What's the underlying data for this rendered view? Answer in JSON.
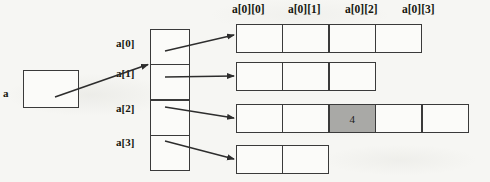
{
  "figure": {
    "type": "jagged-array-memory-diagram",
    "background_color": "#f6f6f3",
    "line_color": "#3a3a3a",
    "text_color": "#17170f",
    "highlight_color": "#a9a9a6"
  },
  "root_pointer": {
    "label": "a",
    "box_value": ""
  },
  "pointer_array": {
    "name": "a",
    "labels": [
      "a[0]",
      "a[1]",
      "a[2]",
      "a[3]"
    ],
    "cells": [
      "",
      "",
      "",
      ""
    ]
  },
  "column_headers": [
    "a[0][0]",
    "a[0][1]",
    "a[0][2]",
    "a[0][3]"
  ],
  "rows": [
    {
      "index": 0,
      "source_label": "a[0]",
      "length": 4,
      "cells": [
        {
          "value": "",
          "highlighted": false
        },
        {
          "value": "",
          "highlighted": false
        },
        {
          "value": "",
          "highlighted": false
        },
        {
          "value": "",
          "highlighted": false
        }
      ]
    },
    {
      "index": 1,
      "source_label": "a[1]",
      "length": 3,
      "cells": [
        {
          "value": "",
          "highlighted": false
        },
        {
          "value": "",
          "highlighted": false
        },
        {
          "value": "",
          "highlighted": false
        }
      ]
    },
    {
      "index": 2,
      "source_label": "a[2]",
      "length": 5,
      "cells": [
        {
          "value": "",
          "highlighted": false
        },
        {
          "value": "",
          "highlighted": false
        },
        {
          "value": "4",
          "highlighted": true
        },
        {
          "value": "",
          "highlighted": false
        },
        {
          "value": "",
          "highlighted": false
        }
      ]
    },
    {
      "index": 3,
      "source_label": "a[3]",
      "length": 2,
      "cells": [
        {
          "value": "",
          "highlighted": false
        },
        {
          "value": "",
          "highlighted": false
        }
      ]
    }
  ],
  "arrows": [
    {
      "name": "a-to-pointer-array",
      "from": "root-pointer-box",
      "to": "pointer-array-cell-0"
    },
    {
      "name": "pointer-0-to-row-0",
      "from": "pointer-array-cell-0",
      "to": "row-0"
    },
    {
      "name": "pointer-1-to-row-1",
      "from": "pointer-array-cell-1",
      "to": "row-1"
    },
    {
      "name": "pointer-2-to-row-2",
      "from": "pointer-array-cell-2",
      "to": "row-2"
    },
    {
      "name": "pointer-3-to-row-3",
      "from": "pointer-array-cell-3",
      "to": "row-3"
    }
  ]
}
